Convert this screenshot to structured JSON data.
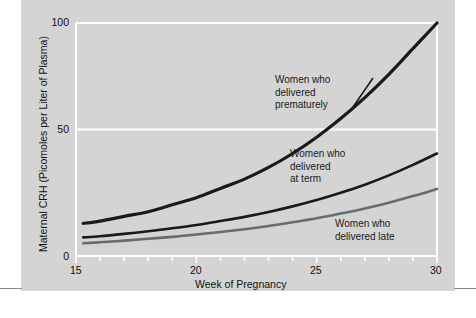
{
  "figure": {
    "background_color": "#d4d4d4",
    "plot_background_color": "#d4d4d4",
    "gridline_color": "#ffffff",
    "axis_color": "#ffffff"
  },
  "axes": {
    "y_label": "Maternal CRH (Picomoles per Liter of Plasma)",
    "x_label": "Week of Pregnancy",
    "y_ticks": [
      "0",
      "50",
      "100"
    ],
    "x_ticks": [
      "15",
      "20",
      "25",
      "30"
    ]
  },
  "annotations": {
    "premature": "Women who\ndelivered\nprematurely",
    "term": "Women who\ndelivered\nat term",
    "late": "Women who\ndelivered late"
  },
  "chart_data": {
    "type": "line",
    "title": "",
    "xlabel": "Week of Pregnancy",
    "ylabel": "Maternal CRH (Picomoles per Liter of Plasma)",
    "xlim": [
      15,
      30
    ],
    "ylim": [
      0,
      100
    ],
    "xticks": [
      15,
      20,
      25,
      30
    ],
    "yticks": [
      0,
      50,
      100
    ],
    "minor_xticks": [
      16,
      17,
      18,
      19,
      21,
      22,
      23,
      24,
      26,
      27,
      28,
      29
    ],
    "grid": true,
    "legend": "inline-annotations",
    "x": [
      15.3,
      16,
      17,
      18,
      19,
      20,
      21,
      22,
      23,
      24,
      25,
      26,
      27,
      28,
      29,
      30
    ],
    "series": [
      {
        "name": "Women who delivered prematurely",
        "color": "#1a1a1a",
        "line_width": 3.2,
        "values": [
          14,
          15,
          17,
          19,
          22,
          25,
          29,
          33,
          38,
          44,
          51,
          59,
          68,
          78,
          89,
          100
        ]
      },
      {
        "name": "Women who delivered at term",
        "color": "#1a1a1a",
        "line_width": 2.6,
        "values": [
          8,
          8.5,
          9.5,
          10.6,
          11.9,
          13.3,
          15,
          16.8,
          18.9,
          21.3,
          24,
          27.1,
          30.6,
          34.6,
          39.1,
          44
        ]
      },
      {
        "name": "Women who delivered late",
        "color": "#6b6b6b",
        "line_width": 2.6,
        "values": [
          5.5,
          5.9,
          6.6,
          7.4,
          8.2,
          9.2,
          10.3,
          11.5,
          12.9,
          14.5,
          16.2,
          18.2,
          20.4,
          22.9,
          25.7,
          28.8
        ]
      }
    ]
  }
}
